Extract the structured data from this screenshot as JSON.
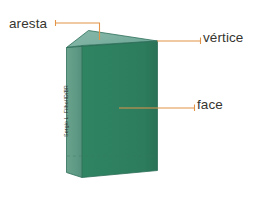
{
  "figure": {
    "background_color": "#ffffff",
    "width": 257,
    "height": 197
  },
  "solid": {
    "name": "triangular-prism",
    "colors": {
      "top_face": "#7fb3a3",
      "left_face": "#5f9b86",
      "front_face": "#2e8060",
      "front_face_shade": "#2b7a5b",
      "edge_line": "#2b6e59",
      "hidden_edge": "#2a6f58"
    }
  },
  "callouts": [
    {
      "id": "aresta",
      "label": "aresta",
      "connector_color": "#e29449"
    },
    {
      "id": "vertice",
      "label": "vértice",
      "connector_color": "#e29449"
    },
    {
      "id": "face",
      "label": "face",
      "connector_color": "#e29449"
    }
  ],
  "credit": {
    "text": "Sergio L. Filho/ID/BR"
  }
}
